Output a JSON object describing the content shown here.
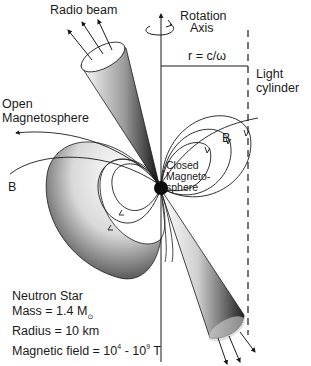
{
  "figure": {
    "colors": {
      "ink": "#1a1a1a",
      "background": "#ffffff",
      "shade_dark": "#111111",
      "shade_light": "#f2f2f2"
    }
  },
  "labels": {
    "radio_beam": "Radio beam",
    "rotation_axis_line1": "Rotation",
    "rotation_axis_line2": "Axis",
    "radius_eq": "r = c/ω",
    "light_cylinder_line1": "Light",
    "light_cylinder_line2": "cylinder",
    "open_magnetosphere_line1": "Open",
    "open_magnetosphere_line2": "Magnetosphere",
    "b_field_left": "B",
    "b_field_right": "B",
    "closed_magnetosphere_line1": "Closed",
    "closed_magnetosphere_line2": "Magneto-",
    "closed_magnetosphere_line3": "sphere"
  },
  "neutron_star": {
    "title": "Neutron Star",
    "mass_label": "Mass = 1.4 M",
    "mass_symbol": "⊙",
    "radius": "Radius = 10 km",
    "field_label": "Magnetic field = 10",
    "field_exp_low": "4",
    "field_mid": " - 10",
    "field_exp_high": "9",
    "field_unit": " T"
  },
  "icons": {
    "rotation_arrow": "curved-rotation-arrow",
    "beam_arrows": "outgoing-ray-arrows",
    "field_line_arrows": "field-direction-chevrons"
  }
}
